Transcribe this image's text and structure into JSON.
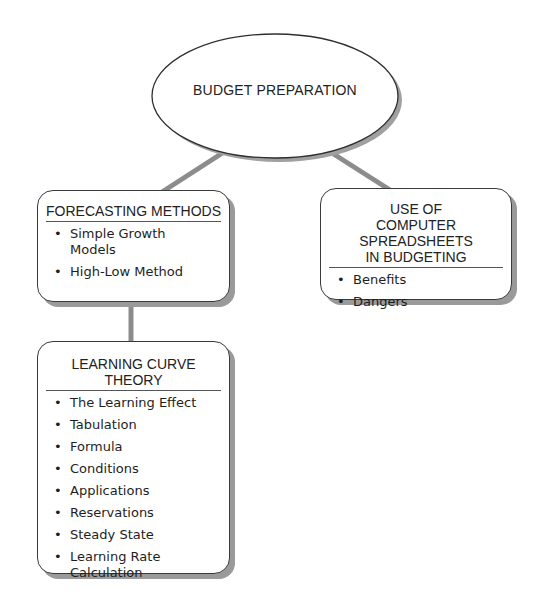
{
  "diagram": {
    "root": {
      "label": "BUDGET PREPARATION"
    },
    "nodes": [
      {
        "id": "forecasting",
        "title": "FORECASTING METHODS",
        "items": [
          "Simple Growth Models",
          "High-Low Method"
        ]
      },
      {
        "id": "spreadsheets",
        "title": "USE OF COMPUTER SPREADSHEETS IN BUDGETING",
        "items": [
          "Benefits",
          "Dangers"
        ]
      },
      {
        "id": "learning-curve",
        "title": "LEARNING CURVE THEORY",
        "items": [
          "The Learning Effect",
          "Tabulation",
          "Formula",
          "Conditions",
          "Applications",
          "Reservations",
          "Steady State",
          "Learning Rate Calculation"
        ]
      }
    ],
    "edges": [
      {
        "from": "root",
        "to": "forecasting"
      },
      {
        "from": "root",
        "to": "spreadsheets"
      },
      {
        "from": "forecasting",
        "to": "learning-curve"
      }
    ],
    "colors": {
      "connector": "#8c8c8c",
      "border": "#3a3a3a",
      "shadow": "#9a9a9a"
    }
  }
}
